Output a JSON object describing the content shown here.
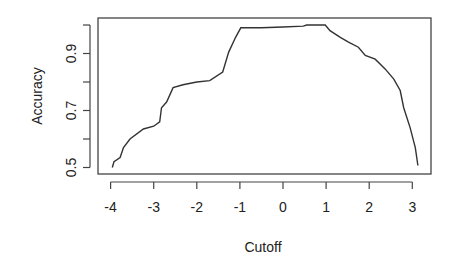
{
  "chart_data": {
    "type": "line",
    "title": "",
    "xlabel": "Cutoff",
    "ylabel": "Accuracy",
    "xlim": [
      -4.25,
      3.45
    ],
    "ylim": [
      0.49,
      1.02
    ],
    "xticks": [
      -4,
      -3,
      -2,
      -1,
      0,
      1,
      2,
      3
    ],
    "xtick_labels": [
      "-4",
      "-3",
      "-2",
      "-1",
      "0",
      "1",
      "2",
      "3"
    ],
    "yticks": [
      0.5,
      0.6,
      0.7,
      0.8,
      0.9,
      1.0
    ],
    "ytick_labels": [
      "0.5",
      "",
      "0.7",
      "",
      "0.9",
      ""
    ],
    "grid": false,
    "legend": null,
    "series": [
      {
        "name": "Accuracy",
        "color": "#333333",
        "x": [
          -3.96,
          -3.92,
          -3.78,
          -3.7,
          -3.55,
          -3.24,
          -3.0,
          -2.86,
          -2.82,
          -2.7,
          -2.55,
          -2.32,
          -2.0,
          -1.7,
          -1.4,
          -1.26,
          -1.1,
          -0.98,
          -0.5,
          0.0,
          0.47,
          0.55,
          0.98,
          1.09,
          1.33,
          1.52,
          1.75,
          1.91,
          2.14,
          2.37,
          2.57,
          2.72,
          2.8,
          2.95,
          3.07,
          3.13
        ],
        "y": [
          0.5,
          0.52,
          0.535,
          0.57,
          0.6,
          0.635,
          0.645,
          0.66,
          0.71,
          0.73,
          0.78,
          0.79,
          0.8,
          0.805,
          0.835,
          0.905,
          0.957,
          0.99,
          0.99,
          0.993,
          0.996,
          1.0,
          1.0,
          0.98,
          0.957,
          0.94,
          0.922,
          0.893,
          0.88,
          0.846,
          0.81,
          0.77,
          0.71,
          0.64,
          0.57,
          0.507
        ]
      }
    ]
  }
}
